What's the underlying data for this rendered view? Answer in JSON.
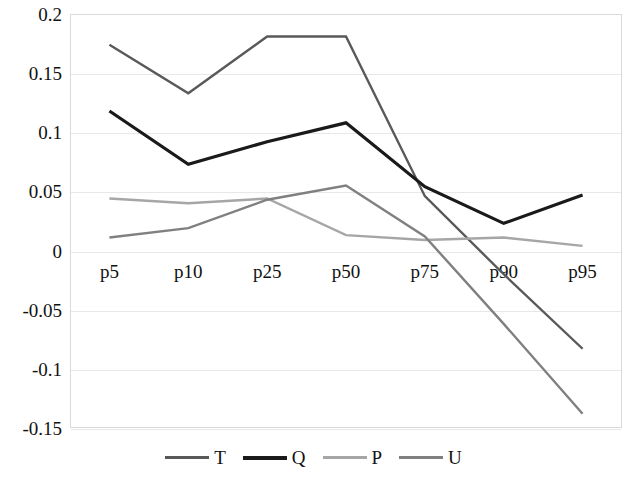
{
  "chart_data": {
    "type": "line",
    "title": "",
    "xlabel": "",
    "ylabel": "",
    "categories": [
      "p5",
      "p10",
      "p25",
      "p50",
      "p75",
      "p90",
      "p95"
    ],
    "ylim": [
      -0.15,
      0.2
    ],
    "yticks": [
      0.2,
      0.15,
      0.1,
      0.05,
      0,
      -0.05,
      -0.1,
      -0.15
    ],
    "ytick_labels": [
      "0.2",
      "0.15",
      "0.1",
      "0.05",
      "0",
      "-0.05",
      "-0.1",
      "-0.15"
    ],
    "grid": true,
    "legend_position": "bottom",
    "series": [
      {
        "name": "T",
        "color": "#595959",
        "values": [
          0.174,
          0.133,
          0.181,
          0.181,
          0.046,
          -0.02,
          -0.083
        ]
      },
      {
        "name": "Q",
        "color": "#1a1a1a",
        "values": [
          0.118,
          0.073,
          0.092,
          0.108,
          0.054,
          0.023,
          0.047
        ]
      },
      {
        "name": "P",
        "color": "#a6a6a6",
        "values": [
          0.044,
          0.04,
          0.044,
          0.013,
          0.009,
          0.011,
          0.004
        ]
      },
      {
        "name": "U",
        "color": "#808080",
        "values": [
          0.011,
          0.019,
          0.043,
          0.055,
          0.012,
          -0.062,
          -0.138
        ]
      }
    ]
  },
  "legend": {
    "items": [
      {
        "label": "T",
        "color": "#595959"
      },
      {
        "label": "Q",
        "color": "#1a1a1a"
      },
      {
        "label": "P",
        "color": "#a6a6a6"
      },
      {
        "label": "U",
        "color": "#808080"
      }
    ]
  },
  "axes": {
    "grid_color": "#e8e8e8",
    "frame_color": "#d9d9d9"
  }
}
